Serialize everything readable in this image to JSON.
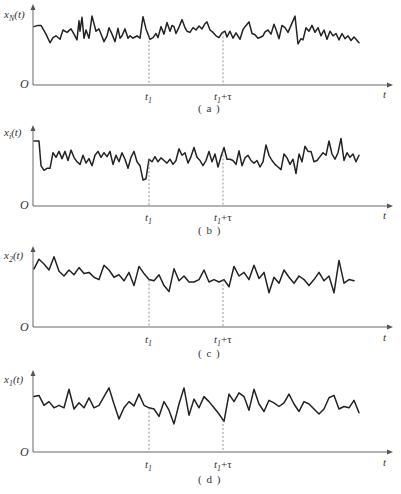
{
  "figure": {
    "panels": [
      {
        "id": "a",
        "caption": "( a )",
        "ylabel": "x_N(t)",
        "ylabel_main": "x",
        "ylabel_sub": "N",
        "ylabel_tail": "(t)",
        "origin": "O",
        "xlabel": "t",
        "t1_label": "t",
        "t1_sub": "1",
        "t1tau_label": "t",
        "t1tau_sub": "1",
        "t1tau_tail": "+τ",
        "top": 0
      },
      {
        "id": "b",
        "caption": "( b )",
        "ylabel": "x_i(t)",
        "ylabel_main": "x",
        "ylabel_sub": "i",
        "ylabel_tail": "(t)",
        "origin": "O",
        "xlabel": "t",
        "t1_label": "t",
        "t1_sub": "1",
        "t1tau_label": "t",
        "t1tau_sub": "1",
        "t1tau_tail": "+τ",
        "top": 120
      },
      {
        "id": "c",
        "caption": "( c )",
        "ylabel": "x_2(t)",
        "ylabel_main": "x",
        "ylabel_sub": "2",
        "ylabel_tail": "(t)",
        "origin": "O",
        "xlabel": "t",
        "t1_label": "t",
        "t1_sub": "1",
        "t1tau_label": "t",
        "t1tau_sub": "1",
        "t1tau_tail": "+τ",
        "top": 242
      },
      {
        "id": "d",
        "caption": "( d )",
        "ylabel": "x_1(t)",
        "ylabel_main": "x",
        "ylabel_sub": "1",
        "ylabel_tail": "(t)",
        "origin": "O",
        "xlabel": "t",
        "t1_label": "t",
        "t1_sub": "1",
        "t1tau_label": "t",
        "t1tau_sub": "1",
        "t1tau_tail": "+τ",
        "top": 367
      }
    ],
    "colors": {
      "line": "#222222",
      "axis": "#555555",
      "dashed": "#777777",
      "text": "#333333"
    }
  },
  "chart_data": [
    {
      "type": "line",
      "title": "(a) x_N(t) — random process sample function",
      "xlabel": "t",
      "ylabel": "x_N(t)",
      "x_markers": [
        "t1",
        "t1+τ"
      ],
      "x": [
        0,
        4,
        7,
        12,
        16,
        19,
        22,
        26,
        29,
        33,
        37,
        40,
        43,
        45,
        46,
        48,
        50,
        52,
        55,
        58,
        62,
        65,
        67,
        70,
        73,
        75,
        78,
        81,
        84,
        86,
        88,
        91,
        94,
        96,
        99,
        101,
        103,
        106,
        109,
        112,
        116,
        119,
        122,
        124,
        127,
        130,
        133,
        136,
        138,
        140,
        142,
        145,
        148,
        151,
        153,
        156,
        159,
        162,
        165,
        168,
        171,
        173,
        176,
        179,
        182,
        185,
        188,
        191,
        193,
        196,
        199,
        202,
        206,
        209,
        212,
        215,
        218,
        221,
        224,
        227,
        229,
        231,
        234,
        237,
        240,
        242,
        245,
        248,
        251,
        254,
        258,
        261,
        264,
        267,
        269,
        272,
        275,
        278,
        281,
        284,
        287,
        290,
        293,
        296,
        299,
        302,
        305,
        308,
        311,
        314,
        317,
        320,
        322,
        325
      ],
      "values": [
        0.68,
        0.7,
        0.7,
        0.55,
        0.4,
        0.49,
        0.52,
        0.46,
        0.62,
        0.58,
        0.64,
        0.55,
        0.45,
        0.78,
        0.6,
        0.84,
        0.48,
        0.62,
        0.48,
        0.86,
        0.6,
        0.64,
        0.55,
        0.42,
        0.52,
        0.66,
        0.55,
        0.42,
        0.65,
        0.48,
        0.52,
        0.64,
        0.48,
        0.52,
        0.48,
        0.5,
        0.52,
        0.48,
        0.85,
        0.64,
        0.46,
        0.49,
        0.56,
        0.49,
        0.68,
        0.55,
        0.75,
        0.6,
        0.7,
        0.68,
        0.56,
        0.67,
        0.8,
        0.66,
        0.6,
        0.58,
        0.66,
        0.62,
        0.69,
        0.64,
        0.73,
        0.76,
        0.62,
        0.58,
        0.52,
        0.49,
        0.57,
        0.6,
        0.5,
        0.6,
        0.48,
        0.57,
        0.46,
        0.63,
        0.7,
        0.76,
        0.56,
        0.54,
        0.48,
        0.5,
        0.52,
        0.59,
        0.62,
        0.55,
        0.72,
        0.63,
        0.47,
        0.7,
        0.66,
        0.58,
        0.74,
        0.86,
        0.38,
        0.47,
        0.45,
        0.66,
        0.6,
        0.7,
        0.58,
        0.66,
        0.52,
        0.62,
        0.46,
        0.6,
        0.52,
        0.56,
        0.45,
        0.56,
        0.47,
        0.52,
        0.44,
        0.5,
        0.46,
        0.4
      ],
      "ylim": [
        0,
        1
      ]
    },
    {
      "type": "line",
      "title": "(b) x_i(t) — random process sample function",
      "xlabel": "t",
      "ylabel": "x_i(t)",
      "x_markers": [
        "t1",
        "t1+τ"
      ],
      "x": [
        0,
        5,
        7,
        10,
        13,
        16,
        19,
        22,
        25,
        28,
        31,
        34,
        37,
        40,
        43,
        46,
        49,
        52,
        55,
        58,
        61,
        64,
        67,
        70,
        73,
        76,
        79,
        82,
        85,
        88,
        91,
        94,
        97,
        100,
        103,
        106,
        109,
        112,
        115,
        118,
        121,
        124,
        127,
        130,
        133,
        136,
        139,
        142,
        145,
        148,
        151,
        154,
        157,
        160,
        163,
        166,
        169,
        172,
        175,
        178,
        181,
        184,
        187,
        190,
        193,
        196,
        199,
        202,
        205,
        208,
        211,
        214,
        217,
        220,
        223,
        226,
        229,
        232,
        235,
        238,
        241,
        244,
        247,
        250,
        253,
        256,
        259,
        262,
        265,
        268,
        271,
        274,
        277,
        280,
        283,
        286,
        289,
        292,
        295,
        298,
        301,
        304,
        307,
        310,
        313,
        316,
        319,
        322,
        325
      ],
      "values": [
        0.8,
        0.8,
        0.42,
        0.35,
        0.38,
        0.38,
        0.62,
        0.55,
        0.64,
        0.53,
        0.64,
        0.5,
        0.66,
        0.55,
        0.48,
        0.44,
        0.58,
        0.46,
        0.53,
        0.42,
        0.58,
        0.64,
        0.55,
        0.62,
        0.56,
        0.64,
        0.44,
        0.58,
        0.48,
        0.62,
        0.52,
        0.38,
        0.55,
        0.64,
        0.48,
        0.42,
        0.2,
        0.22,
        0.52,
        0.48,
        0.56,
        0.48,
        0.54,
        0.5,
        0.46,
        0.52,
        0.44,
        0.5,
        0.68,
        0.58,
        0.62,
        0.46,
        0.56,
        0.7,
        0.55,
        0.5,
        0.42,
        0.5,
        0.64,
        0.48,
        0.6,
        0.4,
        0.56,
        0.7,
        0.52,
        0.52,
        0.5,
        0.44,
        0.65,
        0.42,
        0.54,
        0.58,
        0.5,
        0.46,
        0.5,
        0.4,
        0.48,
        0.74,
        0.58,
        0.5,
        0.44,
        0.4,
        0.36,
        0.6,
        0.54,
        0.44,
        0.52,
        0.3,
        0.6,
        0.48,
        0.72,
        0.64,
        0.64,
        0.48,
        0.5,
        0.56,
        0.62,
        0.58,
        0.8,
        0.6,
        0.52,
        0.62,
        0.84,
        0.5,
        0.62,
        0.55,
        0.6,
        0.48,
        0.58
      ],
      "ylim": [
        0,
        1
      ]
    },
    {
      "type": "line",
      "title": "(c) x_2(t) — random process sample function",
      "xlabel": "t",
      "ylabel": "x_2(t)",
      "x_markers": [
        "t1",
        "t1+τ"
      ],
      "x": [
        0,
        5,
        10,
        15,
        20,
        25,
        30,
        35,
        40,
        45,
        50,
        55,
        60,
        65,
        70,
        75,
        80,
        85,
        90,
        95,
        100,
        105,
        110,
        115,
        120,
        125,
        130,
        135,
        140,
        145,
        150,
        155,
        160,
        165,
        170,
        175,
        180,
        185,
        190,
        195,
        200,
        205,
        210,
        215,
        220,
        225,
        230,
        235,
        240,
        245,
        250,
        255,
        260,
        265,
        270,
        275,
        280,
        285,
        290,
        295,
        300,
        305,
        310,
        315,
        320
      ],
      "values": [
        0.72,
        0.88,
        0.8,
        0.7,
        0.92,
        0.68,
        0.6,
        0.7,
        0.62,
        0.74,
        0.64,
        0.66,
        0.58,
        0.54,
        0.78,
        0.7,
        0.58,
        0.62,
        0.52,
        0.66,
        0.44,
        0.76,
        0.64,
        0.54,
        0.52,
        0.62,
        0.44,
        0.34,
        0.72,
        0.52,
        0.6,
        0.5,
        0.5,
        0.54,
        0.7,
        0.5,
        0.54,
        0.5,
        0.54,
        0.42,
        0.76,
        0.6,
        0.66,
        0.54,
        0.78,
        0.56,
        0.66,
        0.32,
        0.58,
        0.48,
        0.7,
        0.58,
        0.48,
        0.6,
        0.54,
        0.44,
        0.54,
        0.66,
        0.52,
        0.6,
        0.32,
        0.86,
        0.48,
        0.54,
        0.52
      ],
      "ylim": [
        0,
        1
      ]
    },
    {
      "type": "line",
      "title": "(d) x_1(t) — random process sample function",
      "xlabel": "t",
      "ylabel": "x_1(t)",
      "x_markers": [
        "t1",
        "t1+τ"
      ],
      "x": [
        0,
        5,
        10,
        15,
        20,
        25,
        30,
        35,
        40,
        45,
        50,
        55,
        60,
        65,
        70,
        75,
        80,
        85,
        90,
        95,
        100,
        105,
        110,
        115,
        120,
        125,
        130,
        135,
        140,
        145,
        150,
        155,
        160,
        165,
        170,
        175,
        180,
        185,
        190,
        195,
        200,
        205,
        210,
        215,
        220,
        225,
        230,
        235,
        240,
        245,
        250,
        255,
        260,
        265,
        270,
        275,
        280,
        285,
        290,
        295,
        300,
        305,
        310,
        315,
        320,
        325
      ],
      "values": [
        0.7,
        0.72,
        0.56,
        0.62,
        0.52,
        0.56,
        0.52,
        0.82,
        0.5,
        0.6,
        0.52,
        0.68,
        0.52,
        0.56,
        0.7,
        0.84,
        0.58,
        0.34,
        0.52,
        0.62,
        0.55,
        0.74,
        0.56,
        0.52,
        0.5,
        0.38,
        0.62,
        0.48,
        0.26,
        0.58,
        0.84,
        0.4,
        0.66,
        0.52,
        0.7,
        0.62,
        0.52,
        0.42,
        0.3,
        0.74,
        0.62,
        0.76,
        0.7,
        0.48,
        0.82,
        0.58,
        0.46,
        0.64,
        0.6,
        0.54,
        0.6,
        0.74,
        0.58,
        0.46,
        0.62,
        0.58,
        0.5,
        0.42,
        0.5,
        0.68,
        0.72,
        0.5,
        0.54,
        0.52,
        0.64,
        0.44
      ],
      "ylim": [
        0,
        1
      ]
    }
  ]
}
